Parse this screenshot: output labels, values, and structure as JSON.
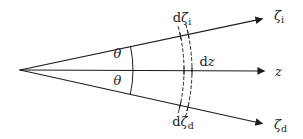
{
  "figure": {
    "ink": "#1c1c1c",
    "background": "#ffffff",
    "angle_labels": {
      "upper": "θ",
      "lower": "θ"
    },
    "axes": {
      "upper": {
        "symbol": "ζ",
        "sub": "i"
      },
      "middle": {
        "symbol": "z",
        "sub": ""
      },
      "lower": {
        "symbol": "ζ",
        "sub": "d"
      }
    },
    "intervals": {
      "upper": {
        "prefix": "d",
        "symbol": "ζ",
        "sub": "i"
      },
      "middle": {
        "prefix": "d",
        "symbol": "z",
        "sub": ""
      },
      "lower": {
        "prefix": "d",
        "symbol": "ζ",
        "sub": "d"
      }
    }
  }
}
